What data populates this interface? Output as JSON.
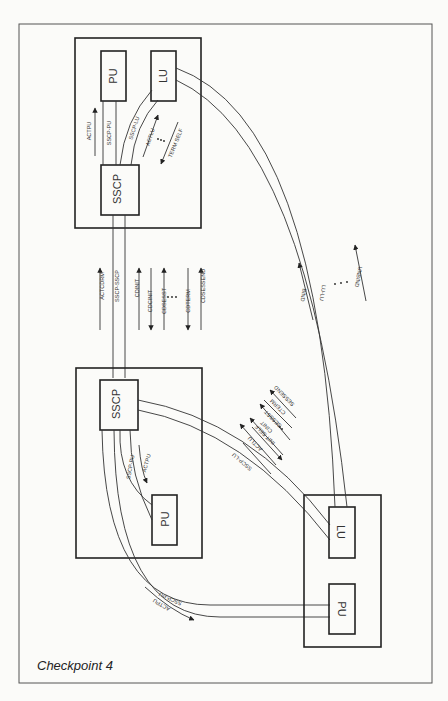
{
  "caption": "Checkpoint 4",
  "nodes": {
    "top_domain": {
      "pu": "PU",
      "lu": "LU",
      "sscp": "SSCP"
    },
    "left_domain": {
      "sscp": "SSCP",
      "pu": "PU"
    },
    "bottom_right_node": {
      "lu": "LU",
      "pu": "PU"
    }
  },
  "sessions": {
    "top_sscp_pu": "SSCP-PU",
    "top_sscp_lu": "SSCP-LU",
    "sscp_sscp": "SSCP-SSCP",
    "left_sscp_pu": "SSCP-PU",
    "sscp_remote_pu": "SSCP-PU",
    "sscp_remote_lu": "SSCP-LU",
    "lu_lu": "LU-LU"
  },
  "flows": {
    "top_actpu": "ACTPU",
    "top_actlu": "ACTLU",
    "top_term_self": "TERM SELF",
    "cross_domain": [
      "ACTCDRM",
      "CDINIT",
      "CDCINIT",
      "CDSESST",
      "CDTERM",
      "CDSESSEND"
    ],
    "left_actpu": "ACTPU",
    "remote_actpu": "ACTPU",
    "remote_lu": [
      "ACTLU",
      "INIT SELF",
      "CINIT",
      "SESSST",
      "CTERM",
      "SESSEND"
    ],
    "lu_lu": [
      "BIND",
      "UNBIND"
    ]
  },
  "colors": {
    "line": "#333333",
    "background": "#fbfbf9"
  }
}
